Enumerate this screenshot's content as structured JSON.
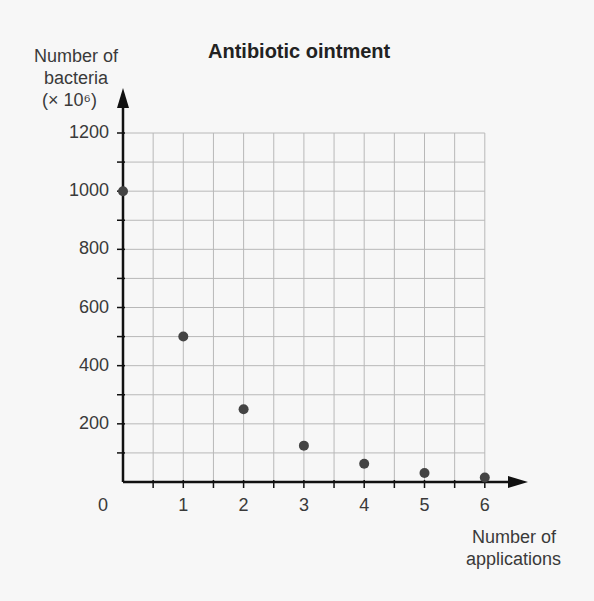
{
  "chart_data": {
    "type": "scatter",
    "title": "Antibiotic ointment",
    "ylabel_lines": [
      "Number of",
      "bacteria",
      "(× 10⁶)"
    ],
    "xlabel_lines": [
      "Number of",
      "applications"
    ],
    "x": [
      0,
      1,
      2,
      3,
      4,
      5,
      6
    ],
    "values": [
      1000,
      500,
      250,
      125,
      62.5,
      31.25,
      15.6
    ],
    "xlim": [
      0,
      6
    ],
    "ylim": [
      0,
      1200
    ],
    "x_ticks": [
      "0",
      "1",
      "2",
      "3",
      "4",
      "5",
      "6"
    ],
    "y_ticks": [
      "200",
      "400",
      "600",
      "800",
      "1000",
      "1200"
    ],
    "grid": true,
    "point_color": "#444444"
  }
}
